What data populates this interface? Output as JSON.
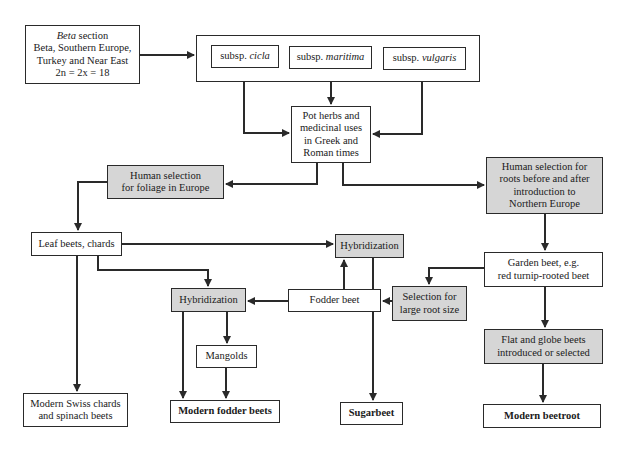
{
  "diagram": {
    "nodes": {
      "beta_section": {
        "line1_italic": "Beta",
        "line1_rest": " section",
        "line2": "Beta, Southern Europe,",
        "line3": "Turkey and Near East",
        "line4": "2n = 2x = 18"
      },
      "subsp_cicla": {
        "prefix": "subsp. ",
        "name": "cicla"
      },
      "subsp_maritima": {
        "prefix": "subsp. ",
        "name": "maritima"
      },
      "subsp_vulgaris": {
        "prefix": "subsp. ",
        "name": "vulgaris"
      },
      "pot_herbs": {
        "lines": [
          "Pot herbs and",
          "medicinal uses",
          "in Greek and",
          "Roman times"
        ]
      },
      "selection_foliage": {
        "lines": [
          "Human selection",
          "for foliage in Europe"
        ]
      },
      "selection_roots": {
        "lines": [
          "Human selection for",
          "roots before and after",
          "introduction to",
          "Northern Europe"
        ]
      },
      "leaf_beets": {
        "label": "Leaf beets, chards"
      },
      "hybridization_top": {
        "label": "Hybridization"
      },
      "garden_beet": {
        "lines": [
          "Garden beet, e.g.",
          "red turnip-rooted beet"
        ]
      },
      "selection_large_root": {
        "lines": [
          "Selection for",
          "large root size"
        ]
      },
      "fodder_beet": {
        "label": "Fodder beet"
      },
      "hybridization_left": {
        "label": "Hybridization"
      },
      "mangolds": {
        "label": "Mangolds"
      },
      "flat_globe": {
        "lines": [
          "Flat and globe beets",
          "introduced or selected"
        ]
      },
      "modern_swiss": {
        "lines": [
          "Modern Swiss chards",
          "and spinach beets"
        ]
      },
      "modern_fodder": {
        "label": "Modern fodder beets"
      },
      "sugarbeet": {
        "label": "Sugarbeet"
      },
      "modern_beetroot": {
        "label": "Modern beetroot"
      }
    },
    "colors": {
      "grey_fill": "#d6d6d6",
      "line": "#2a2a2a"
    }
  }
}
